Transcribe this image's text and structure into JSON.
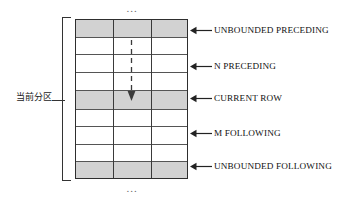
{
  "diagram": {
    "ellipsis_top": "...",
    "ellipsis_bottom": "...",
    "partition_label": "当前分区",
    "accent_color": "#d2d2d2",
    "line_color": "#2e2e2e",
    "table": {
      "columns": 3,
      "rows": [
        {
          "index": 1,
          "shaded": true,
          "label": "UNBOUNDED PRECEDING"
        },
        {
          "index": 2,
          "shaded": false,
          "label": ""
        },
        {
          "index": 3,
          "shaded": false,
          "label": "N PRECEDING"
        },
        {
          "index": 4,
          "shaded": false,
          "label": ""
        },
        {
          "index": 5,
          "shaded": true,
          "label": "CURRENT ROW"
        },
        {
          "index": 6,
          "shaded": false,
          "label": ""
        },
        {
          "index": 7,
          "shaded": false,
          "label": "M FOLLOWING"
        },
        {
          "index": 8,
          "shaded": false,
          "label": ""
        },
        {
          "index": 9,
          "shaded": true,
          "label": "UNBOUNDED FOLLOWING"
        }
      ]
    },
    "callouts": [
      {
        "id": "unbounded-preceding",
        "text": "UNBOUNDED PRECEDING"
      },
      {
        "id": "n-preceding",
        "text": "N PRECEDING"
      },
      {
        "id": "current-row",
        "text": "CURRENT ROW"
      },
      {
        "id": "m-following",
        "text": "M FOLLOWING"
      },
      {
        "id": "unbounded-following",
        "text": "UNBOUNDED FOLLOWING"
      }
    ],
    "flow_arrow": {
      "icon": "dashed-down-arrow-icon",
      "direction": "down",
      "style": "dashed"
    }
  }
}
